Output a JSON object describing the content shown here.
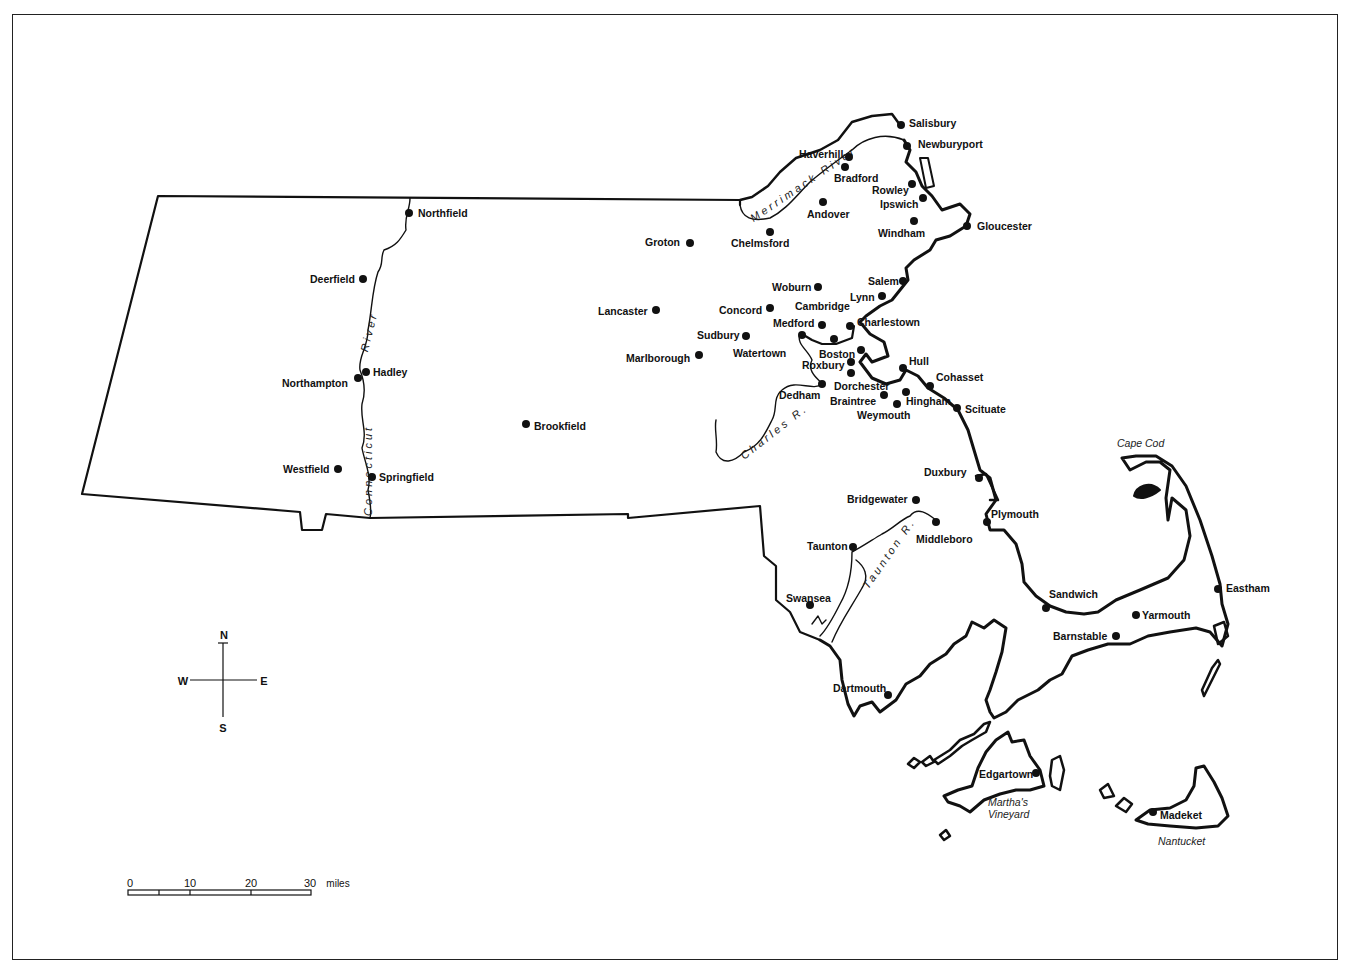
{
  "map": {
    "subject": "Colonial Massachusetts towns",
    "colors": {
      "ink": "#111111",
      "background": "#ffffff"
    },
    "towns": [
      {
        "name": "Salisbury",
        "x": 901,
        "y": 125,
        "lx": 909,
        "ly": 118
      },
      {
        "name": "Newburyport",
        "x": 907,
        "y": 146,
        "lx": 918,
        "ly": 139
      },
      {
        "name": "Haverhill",
        "x": 849,
        "y": 157,
        "lx": 799,
        "ly": 149
      },
      {
        "name": "Bradford",
        "x": 845,
        "y": 167,
        "lx": 834,
        "ly": 173
      },
      {
        "name": "Rowley",
        "x": 912,
        "y": 184,
        "lx": 872,
        "ly": 185
      },
      {
        "name": "Ipswich",
        "x": 923,
        "y": 198,
        "lx": 880,
        "ly": 199
      },
      {
        "name": "Andover",
        "x": 823,
        "y": 202,
        "lx": 807,
        "ly": 209
      },
      {
        "name": "Windham",
        "x": 914,
        "y": 221,
        "lx": 878,
        "ly": 228
      },
      {
        "name": "Gloucester",
        "x": 967,
        "y": 226,
        "lx": 977,
        "ly": 221
      },
      {
        "name": "Chelmsford",
        "x": 770,
        "y": 232,
        "lx": 731,
        "ly": 238
      },
      {
        "name": "Groton",
        "x": 690,
        "y": 243,
        "lx": 645,
        "ly": 237
      },
      {
        "name": "Northfield",
        "x": 409,
        "y": 213,
        "lx": 418,
        "ly": 208
      },
      {
        "name": "Deerfield",
        "x": 363,
        "y": 279,
        "lx": 310,
        "ly": 274
      },
      {
        "name": "Woburn",
        "x": 818,
        "y": 287,
        "lx": 772,
        "ly": 282
      },
      {
        "name": "Salem",
        "x": 903,
        "y": 281,
        "lx": 868,
        "ly": 276
      },
      {
        "name": "Lynn",
        "x": 882,
        "y": 296,
        "lx": 850,
        "ly": 292
      },
      {
        "name": "Lancaster",
        "x": 656,
        "y": 310,
        "lx": 598,
        "ly": 306
      },
      {
        "name": "Concord",
        "x": 770,
        "y": 308,
        "lx": 719,
        "ly": 305
      },
      {
        "name": "Cambridge",
        "x": 834,
        "y": 339,
        "lx": 795,
        "ly": 301
      },
      {
        "name": "Medford",
        "x": 822,
        "y": 325,
        "lx": 773,
        "ly": 318
      },
      {
        "name": "Charlestown",
        "x": 850,
        "y": 326,
        "lx": 857,
        "ly": 317
      },
      {
        "name": "Sudbury",
        "x": 746,
        "y": 336,
        "lx": 697,
        "ly": 330
      },
      {
        "name": "Watertown",
        "x": 802,
        "y": 335,
        "lx": 733,
        "ly": 348
      },
      {
        "name": "Marlborough",
        "x": 699,
        "y": 355,
        "lx": 626,
        "ly": 353
      },
      {
        "name": "Boston",
        "x": 861,
        "y": 350,
        "lx": 819,
        "ly": 349
      },
      {
        "name": "Roxbury",
        "x": 851,
        "y": 362,
        "lx": 802,
        "ly": 360
      },
      {
        "name": "Dorchester",
        "x": 851,
        "y": 373,
        "lx": 834,
        "ly": 381
      },
      {
        "name": "Hull",
        "x": 903,
        "y": 368,
        "lx": 909,
        "ly": 356
      },
      {
        "name": "Hadley",
        "x": 366,
        "y": 372,
        "lx": 373,
        "ly": 367
      },
      {
        "name": "Northampton",
        "x": 358,
        "y": 378,
        "lx": 282,
        "ly": 378
      },
      {
        "name": "Cohasset",
        "x": 930,
        "y": 386,
        "lx": 936,
        "ly": 372
      },
      {
        "name": "Dedham",
        "x": 822,
        "y": 384,
        "lx": 779,
        "ly": 390
      },
      {
        "name": "Braintree",
        "x": 884,
        "y": 395,
        "lx": 830,
        "ly": 396
      },
      {
        "name": "Hingham",
        "x": 906,
        "y": 392,
        "lx": 906,
        "ly": 396
      },
      {
        "name": "Weymouth",
        "x": 897,
        "y": 404,
        "lx": 857,
        "ly": 410
      },
      {
        "name": "Scituate",
        "x": 957,
        "y": 408,
        "lx": 965,
        "ly": 404
      },
      {
        "name": "Brookfield",
        "x": 526,
        "y": 424,
        "lx": 534,
        "ly": 421
      },
      {
        "name": "Westfield",
        "x": 338,
        "y": 469,
        "lx": 283,
        "ly": 464
      },
      {
        "name": "Springfield",
        "x": 372,
        "y": 477,
        "lx": 379,
        "ly": 472
      },
      {
        "name": "Duxbury",
        "x": 979,
        "y": 478,
        "lx": 924,
        "ly": 467
      },
      {
        "name": "Bridgewater",
        "x": 916,
        "y": 500,
        "lx": 847,
        "ly": 494
      },
      {
        "name": "Plymout­h",
        "x": 987,
        "y": 522,
        "lx": 991,
        "ly": 509
      },
      {
        "name": "Middleboro",
        "x": 936,
        "y": 522,
        "lx": 916,
        "ly": 534
      },
      {
        "name": "Taunton",
        "x": 853,
        "y": 547,
        "lx": 807,
        "ly": 541
      },
      {
        "name": "Swansea",
        "x": 810,
        "y": 605,
        "lx": 786,
        "ly": 593
      },
      {
        "name": "Sandwich",
        "x": 1046,
        "y": 608,
        "lx": 1049,
        "ly": 589
      },
      {
        "name": "Yarmouth",
        "x": 1136,
        "y": 615,
        "lx": 1142,
        "ly": 610
      },
      {
        "name": "Barnstable",
        "x": 1116,
        "y": 636,
        "lx": 1053,
        "ly": 631
      },
      {
        "name": "Eastham",
        "x": 1218,
        "y": 589,
        "lx": 1226,
        "ly": 583
      },
      {
        "name": "Dartmouth",
        "x": 888,
        "y": 695,
        "lx": 833,
        "ly": 683
      },
      {
        "name": "Edgartown",
        "x": 1036,
        "y": 773,
        "lx": 979,
        "ly": 769
      },
      {
        "name": "Madeket",
        "x": 1153,
        "y": 812,
        "lx": 1160,
        "ly": 810
      }
    ],
    "geographic_labels": [
      {
        "text": "Cape Cod",
        "x": 1117,
        "y": 438
      },
      {
        "text": "Martha's",
        "x": 1011,
        "y": 795
      },
      {
        "text": "Vineyard",
        "x": 1010,
        "y": 808
      },
      {
        "text": "Nantucket",
        "x": 1158,
        "y": 835
      }
    ],
    "rivers": [
      {
        "name": "Merrimack River",
        "label": "Merrimack River"
      },
      {
        "name": "Connecticut River",
        "label_lower": "Connecticut",
        "label_upper": "River"
      },
      {
        "name": "Charles River",
        "label": "Charles R."
      },
      {
        "name": "Taunton River",
        "label": "Taunton R."
      }
    ]
  },
  "compass": {
    "n": "N",
    "s": "S",
    "e": "E",
    "w": "W"
  },
  "scale_bar": {
    "ticks": [
      "0",
      "10",
      "20",
      "30"
    ],
    "unit": "miles"
  }
}
